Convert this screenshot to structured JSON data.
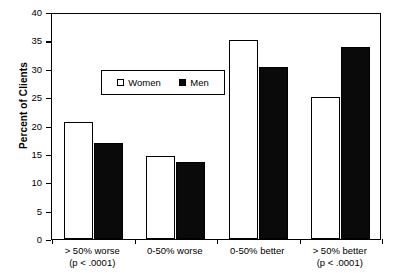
{
  "chart_data": {
    "type": "bar",
    "title": "",
    "xlabel": "",
    "ylabel": "Percent of Clients",
    "ylim": [
      0,
      40
    ],
    "yticks": [
      0,
      5,
      10,
      15,
      20,
      25,
      30,
      35,
      40
    ],
    "ytick_labels": [
      "0",
      "5",
      "10",
      "15",
      "20",
      "25",
      "30",
      "35",
      "40"
    ],
    "grid": false,
    "legend_position": "upper center",
    "categories": [
      "> 50% worse",
      "0-50% worse",
      "0-50% better",
      "> 50% better"
    ],
    "category_sublabels": [
      "(p < .0001)",
      "",
      "",
      "(p < .0001)"
    ],
    "series": [
      {
        "name": "Women",
        "values": [
          20.7,
          14.6,
          35.0,
          25.0
        ],
        "color": "#ffffff"
      },
      {
        "name": "Men",
        "values": [
          16.9,
          13.6,
          30.3,
          33.8
        ],
        "color": "#0a0a0a"
      }
    ]
  },
  "legend": {
    "entries": [
      {
        "label": "Women",
        "swatch": "open-square"
      },
      {
        "label": "Men",
        "swatch": "filled-square"
      }
    ]
  },
  "axis": {
    "y_title": "Percent of Clients"
  }
}
